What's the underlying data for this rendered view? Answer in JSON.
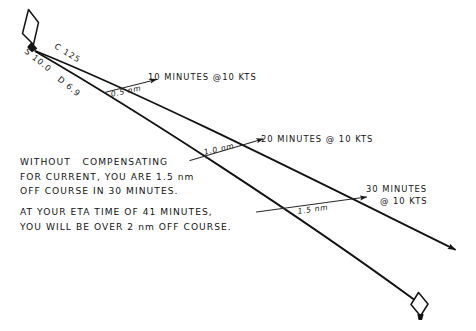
{
  "diagram": {
    "ink_color": "#121212",
    "background": "#ffffff",
    "start_marker": {
      "name": "departure-buoy",
      "shape": "diamond"
    },
    "end_marker": {
      "name": "destination-buoy",
      "shape": "diamond"
    },
    "course_line_labels": {
      "speed": "S 10.0",
      "course": "C 125",
      "drift": "D 6.9"
    },
    "offset_segments": [
      {
        "distance": "0.5 nm",
        "time": "10 MINUTES @10 KTS"
      },
      {
        "distance": "1.0 nm",
        "time": "20 MINUTES @ 10 KTS"
      },
      {
        "distance": "1.5 nm",
        "time_line1": "30 MINUTES",
        "time_line2": "@ 10 KTS"
      }
    ],
    "notes": {
      "paragraph1": [
        "WITHOUT   COMPENSATING",
        "FOR CURRENT, YOU ARE 1.5 nm",
        "OFF COURSE IN 30 MINUTES."
      ],
      "paragraph2": [
        "AT YOUR ETA TIME OF 41 MINUTES,",
        "YOU WILL BE OVER 2 nm OFF COURSE."
      ]
    }
  }
}
